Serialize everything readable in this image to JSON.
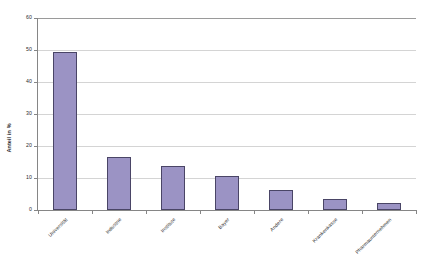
{
  "chart_data": {
    "type": "bar",
    "title": "",
    "xlabel": "",
    "ylabel": "Anteil in %",
    "ylim": [
      0,
      60
    ],
    "yticks": [
      0,
      10,
      20,
      30,
      40,
      50,
      60
    ],
    "grid": true,
    "legend": "none",
    "categories": [
      "Universität",
      "Industrie",
      "Institute",
      "Bayer",
      "Andere",
      "Krankenkasse",
      "Pharmaunternehmen"
    ],
    "values": [
      49.5,
      16.5,
      13.8,
      10.6,
      6.2,
      3.3,
      2.2
    ],
    "bar_color": "#9b93c4",
    "bar_border_color": "#4a4566",
    "gridline_color": "#d4d4d4",
    "axis_color": "#868686",
    "background_color": "#ffffff"
  }
}
